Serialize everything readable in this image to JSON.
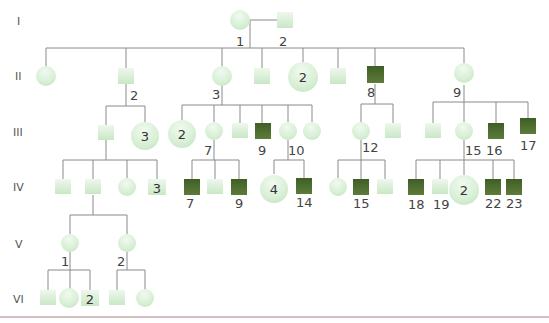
{
  "diagram": {
    "type": "pedigree-chart",
    "generations": [
      "I",
      "II",
      "III",
      "IV",
      "V",
      "VI"
    ],
    "legend_colors": {
      "unaffected": "#d8efd6",
      "affected": "#4e6e2e",
      "line": "#8a8a8a",
      "bottom_rule": "#c9a8ae"
    },
    "individuals": [
      {
        "id": "I-1",
        "sex": "female",
        "affected": false,
        "label": "1",
        "x": 240,
        "y": 20
      },
      {
        "id": "I-2",
        "sex": "male",
        "affected": false,
        "label": "2",
        "x": 285,
        "y": 20
      },
      {
        "id": "II-a",
        "sex": "female",
        "affected": false,
        "x": 46,
        "y": 76
      },
      {
        "id": "II-2",
        "sex": "male",
        "affected": false,
        "label": "2",
        "x": 126,
        "y": 76
      },
      {
        "id": "II-3",
        "sex": "female",
        "affected": false,
        "label": "3",
        "x": 222,
        "y": 76
      },
      {
        "id": "II-b",
        "sex": "male",
        "affected": false,
        "x": 262,
        "y": 76
      },
      {
        "id": "II-grp",
        "sex": "female",
        "affected": false,
        "count": "2",
        "x": 303,
        "y": 76
      },
      {
        "id": "II-c",
        "sex": "male",
        "affected": false,
        "x": 338,
        "y": 76
      },
      {
        "id": "II-8",
        "sex": "male",
        "affected": true,
        "label": "8",
        "x": 375,
        "y": 76
      },
      {
        "id": "II-9",
        "sex": "female",
        "affected": false,
        "label": "9",
        "x": 464,
        "y": 76
      },
      {
        "id": "III-a",
        "sex": "male",
        "affected": false,
        "x": 106,
        "y": 133
      },
      {
        "id": "III-grp1",
        "sex": "female",
        "affected": false,
        "count": "3",
        "x": 145,
        "y": 136
      },
      {
        "id": "III-grp2",
        "sex": "female",
        "affected": false,
        "count": "2",
        "x": 182,
        "y": 134
      },
      {
        "id": "III-7",
        "sex": "female",
        "affected": false,
        "label": "7",
        "x": 214,
        "y": 131
      },
      {
        "id": "III-b",
        "sex": "male",
        "affected": false,
        "x": 240,
        "y": 131
      },
      {
        "id": "III-9",
        "sex": "male",
        "affected": true,
        "label": "9",
        "x": 262,
        "y": 131
      },
      {
        "id": "III-10",
        "sex": "female",
        "affected": false,
        "label": "10",
        "x": 288,
        "y": 131
      },
      {
        "id": "III-c",
        "sex": "female",
        "affected": false,
        "x": 312,
        "y": 131
      },
      {
        "id": "III-12",
        "sex": "female",
        "affected": false,
        "label": "12",
        "x": 361,
        "y": 131
      },
      {
        "id": "III-d",
        "sex": "male",
        "affected": false,
        "x": 393,
        "y": 131
      },
      {
        "id": "III-e",
        "sex": "male",
        "affected": false,
        "x": 433,
        "y": 131
      },
      {
        "id": "III-15",
        "sex": "female",
        "affected": false,
        "label": "15",
        "x": 464,
        "y": 131
      },
      {
        "id": "III-16",
        "sex": "male",
        "affected": true,
        "label": "16",
        "x": 496,
        "y": 131
      },
      {
        "id": "III-17",
        "sex": "male",
        "affected": true,
        "label": "17",
        "x": 528,
        "y": 131
      },
      {
        "id": "IV-a",
        "sex": "male",
        "affected": false,
        "x": 63,
        "y": 187
      },
      {
        "id": "IV-b",
        "sex": "male",
        "affected": false,
        "x": 93,
        "y": 187
      },
      {
        "id": "IV-c",
        "sex": "female",
        "affected": false,
        "x": 127,
        "y": 187
      },
      {
        "id": "IV-grp",
        "sex": "male",
        "affected": false,
        "count": "3",
        "x": 157,
        "y": 187
      },
      {
        "id": "IV-7",
        "sex": "male",
        "affected": true,
        "label": "7",
        "x": 192,
        "y": 187
      },
      {
        "id": "IV-d",
        "sex": "male",
        "affected": false,
        "x": 215,
        "y": 187
      },
      {
        "id": "IV-9",
        "sex": "male",
        "affected": true,
        "label": "9",
        "x": 239,
        "y": 187
      },
      {
        "id": "IV-grp2",
        "sex": "female",
        "affected": false,
        "count": "4",
        "x": 274,
        "y": 189
      },
      {
        "id": "IV-14",
        "sex": "male",
        "affected": true,
        "label": "14",
        "x": 304,
        "y": 187
      },
      {
        "id": "IV-e",
        "sex": "female",
        "affected": false,
        "x": 338,
        "y": 187
      },
      {
        "id": "IV-15",
        "sex": "male",
        "affected": true,
        "label": "15",
        "x": 361,
        "y": 187
      },
      {
        "id": "IV-f",
        "sex": "male",
        "affected": false,
        "x": 385,
        "y": 187
      },
      {
        "id": "IV-18",
        "sex": "male",
        "affected": true,
        "label": "18",
        "x": 416,
        "y": 187
      },
      {
        "id": "IV-19",
        "sex": "male",
        "affected": false,
        "label": "19",
        "x": 440,
        "y": 187
      },
      {
        "id": "IV-grp3",
        "sex": "female",
        "affected": false,
        "count": "2",
        "x": 464,
        "y": 190
      },
      {
        "id": "IV-22",
        "sex": "male",
        "affected": true,
        "label": "22",
        "x": 493,
        "y": 187
      },
      {
        "id": "IV-23",
        "sex": "male",
        "affected": true,
        "label": "23",
        "x": 514,
        "y": 187
      },
      {
        "id": "V-1",
        "sex": "female",
        "affected": false,
        "label": "1",
        "x": 70,
        "y": 243
      },
      {
        "id": "V-2",
        "sex": "female",
        "affected": false,
        "label": "2",
        "x": 127,
        "y": 243
      },
      {
        "id": "VI-a",
        "sex": "male",
        "affected": false,
        "x": 48,
        "y": 298
      },
      {
        "id": "VI-b",
        "sex": "female",
        "affected": false,
        "x": 69,
        "y": 298
      },
      {
        "id": "VI-grp",
        "sex": "male",
        "affected": false,
        "count": "2",
        "x": 90,
        "y": 298
      },
      {
        "id": "VI-c",
        "sex": "male",
        "affected": false,
        "x": 117,
        "y": 298
      },
      {
        "id": "VI-d",
        "sex": "female",
        "affected": false,
        "x": 145,
        "y": 298
      }
    ]
  }
}
